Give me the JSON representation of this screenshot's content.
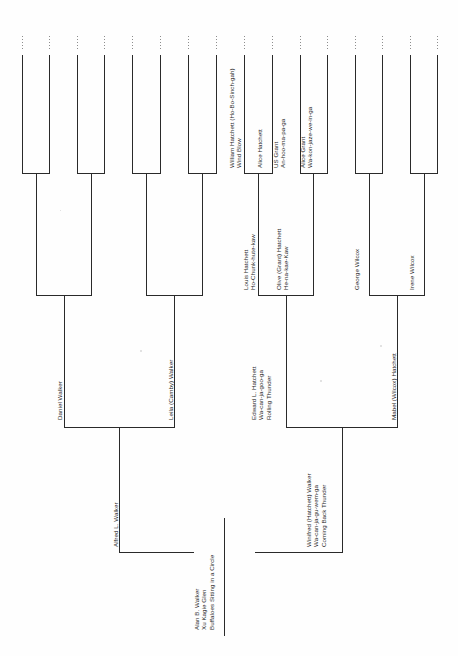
{
  "document": {
    "type": "pedigree-chart",
    "orientation": "rotated-90-ccw",
    "title_text": ""
  },
  "people": {
    "subject": {
      "line1": "Alan B. Walker",
      "line2": "Xu Kagie Glen",
      "line3": "Buffaloes Sitting in a Circle"
    },
    "father": {
      "line1": "Alfred L. Walker"
    },
    "mother": {
      "line1": "Winifred (Hatchett) Walker",
      "line2": "Wa-can-ja-gu-wem-ga",
      "line3": "Coming Back Thunder"
    },
    "paternal_grandfather": {
      "line1": "Daniel Walker"
    },
    "paternal_grandmother": {
      "line1": "Leila (Camby) Walker"
    },
    "maternal_grandfather": {
      "line1": "Edward L. Hatchett",
      "line2": "Wa-can-ja-goo-ga",
      "line3": "Rolling Thunder"
    },
    "maternal_grandmother": {
      "line1": "Mabel (Wilcox) Hatchett"
    },
    "maternal_great_grandfather_1": {
      "line1": "Louis Hatchett",
      "line2": "Ho-Chunk-hute-kaw"
    },
    "maternal_great_grandmother_1": {
      "line1": "Olive (Grant) Hatchett",
      "line2": "He-na-kae-Kaw"
    },
    "maternal_great_grandfather_2": {
      "line1": "George Wilcox"
    },
    "maternal_great_grandmother_2": {
      "line1": "Irene Wilcox"
    },
    "gg_grandfather_hatchett": {
      "line1": "William Hatchett (Ho-Bo-Sinch-gah)",
      "line2": "Wind Blow"
    },
    "gg_grandmother_hatchett": {
      "line1": "Alice Hatchett"
    },
    "gg_grandfather_grant": {
      "line1": "US Grant",
      "line2": "An-hoo-ma-pa-ga"
    },
    "gg_grandmother_grant": {
      "line1": "Alice Grant",
      "line2": "Wa-kon-jaze-we-in-ga"
    }
  },
  "colors": {
    "ink": "#1f1f1f",
    "rule": "#2a2a2a",
    "faint_rule": "#9a9a9a",
    "paper": "#ffffff"
  }
}
